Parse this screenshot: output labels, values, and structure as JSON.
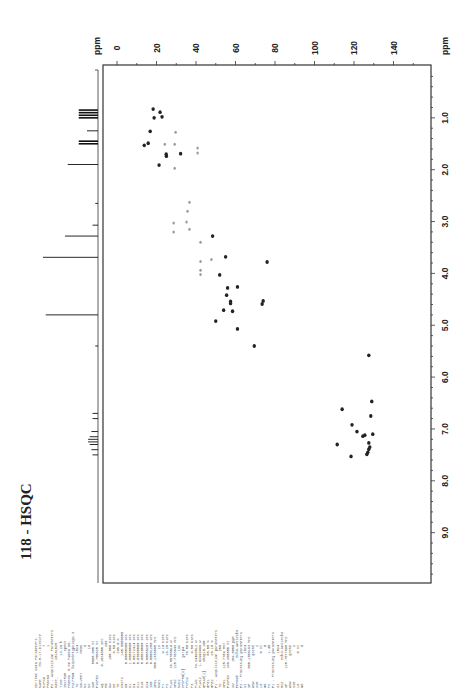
{
  "title": "118 - HSQC",
  "chart_data": {
    "type": "scatter",
    "title": "118 - HSQC",
    "orientation": "rotated 90° (F2 1H axis vertical on right, F1 13C axis horizontal on top)",
    "x_axis": {
      "label": "ppm",
      "nucleus": "13C (F1)",
      "ticks": [
        0,
        20,
        40,
        60,
        80,
        100,
        120,
        140
      ],
      "range": [
        -7,
        158
      ]
    },
    "y_axis": {
      "label": "ppm",
      "nucleus": "1H (F2)",
      "ticks": [
        "1.0",
        "2.0",
        "3.0",
        "4.0",
        "5.0",
        "6.0",
        "7.0",
        "8.0",
        "9.0"
      ],
      "range": [
        0,
        9.95
      ]
    },
    "grid": false,
    "series": [
      {
        "name": "cross peaks (positive, dark)",
        "color": "#222222",
        "points": [
          {
            "c13": 18.3,
            "h1": 0.83
          },
          {
            "c13": 21.8,
            "h1": 0.89
          },
          {
            "c13": 18.8,
            "h1": 1.0
          },
          {
            "c13": 22.8,
            "h1": 0.98
          },
          {
            "c13": 16.8,
            "h1": 1.26
          },
          {
            "c13": 13.8,
            "h1": 1.53
          },
          {
            "c13": 15.8,
            "h1": 1.49
          },
          {
            "c13": 24.9,
            "h1": 1.7
          },
          {
            "c13": 25.0,
            "h1": 1.74
          },
          {
            "c13": 21.3,
            "h1": 1.91
          },
          {
            "c13": 32.2,
            "h1": 1.69
          },
          {
            "c13": 48.4,
            "h1": 3.28
          },
          {
            "c13": 55.0,
            "h1": 3.68
          },
          {
            "c13": 76.0,
            "h1": 3.78
          },
          {
            "c13": 52.0,
            "h1": 4.03
          },
          {
            "c13": 56.0,
            "h1": 4.28
          },
          {
            "c13": 61.0,
            "h1": 4.26
          },
          {
            "c13": 55.5,
            "h1": 4.42
          },
          {
            "c13": 57.5,
            "h1": 4.54
          },
          {
            "c13": 57.5,
            "h1": 4.58
          },
          {
            "c13": 54.0,
            "h1": 4.71
          },
          {
            "c13": 58.5,
            "h1": 4.73
          },
          {
            "c13": 73.5,
            "h1": 4.59
          },
          {
            "c13": 74.0,
            "h1": 4.53
          },
          {
            "c13": 50.0,
            "h1": 4.92
          },
          {
            "c13": 61.0,
            "h1": 5.07
          },
          {
            "c13": 69.5,
            "h1": 5.4
          },
          {
            "c13": 127.5,
            "h1": 5.58
          },
          {
            "c13": 129.0,
            "h1": 6.47
          },
          {
            "c13": 114.0,
            "h1": 6.62
          },
          {
            "c13": 128.5,
            "h1": 6.75
          },
          {
            "c13": 119.0,
            "h1": 6.92
          },
          {
            "c13": 121.5,
            "h1": 7.05
          },
          {
            "c13": 124.5,
            "h1": 7.14
          },
          {
            "c13": 125.5,
            "h1": 7.12
          },
          {
            "c13": 129.5,
            "h1": 7.1
          },
          {
            "c13": 111.5,
            "h1": 7.3
          },
          {
            "c13": 127.5,
            "h1": 7.27
          },
          {
            "c13": 128.0,
            "h1": 7.35
          },
          {
            "c13": 127.5,
            "h1": 7.39
          },
          {
            "c13": 127.0,
            "h1": 7.45
          },
          {
            "c13": 126.5,
            "h1": 7.49
          },
          {
            "c13": 118.5,
            "h1": 7.53
          }
        ]
      },
      {
        "name": "cross peaks (negative/CH2, gray)",
        "color": "#9a9a9a",
        "points": [
          {
            "c13": 29.7,
            "h1": 1.28
          },
          {
            "c13": 24.2,
            "h1": 1.51
          },
          {
            "c13": 29.2,
            "h1": 1.51
          },
          {
            "c13": 40.8,
            "h1": 1.58
          },
          {
            "c13": 40.8,
            "h1": 1.68
          },
          {
            "c13": 29.2,
            "h1": 1.97
          },
          {
            "c13": 36.7,
            "h1": 2.63
          },
          {
            "c13": 35.7,
            "h1": 2.8
          },
          {
            "c13": 28.7,
            "h1": 3.03
          },
          {
            "c13": 35.2,
            "h1": 3.01
          },
          {
            "c13": 28.7,
            "h1": 3.2
          },
          {
            "c13": 36.7,
            "h1": 3.15
          },
          {
            "c13": 42.3,
            "h1": 3.4
          },
          {
            "c13": 42.3,
            "h1": 3.77
          },
          {
            "c13": 47.8,
            "h1": 3.73
          },
          {
            "c13": 42.3,
            "h1": 3.94
          },
          {
            "c13": 42.3,
            "h1": 4.02
          }
        ]
      }
    ],
    "projection_1H": {
      "position": "left of plot (external 1D 1H spectrum)",
      "peaks": [
        {
          "h1": 0.85,
          "height": 0.35
        },
        {
          "h1": 0.9,
          "height": 0.35
        },
        {
          "h1": 0.95,
          "height": 0.35
        },
        {
          "h1": 1.0,
          "height": 0.35
        },
        {
          "h1": 1.25,
          "height": 0.2
        },
        {
          "h1": 1.45,
          "height": 0.35
        },
        {
          "h1": 1.5,
          "height": 0.35
        },
        {
          "h1": 1.9,
          "height": 0.55
        },
        {
          "h1": 2.65,
          "height": 0.05
        },
        {
          "h1": 3.07,
          "height": 0.1
        },
        {
          "h1": 3.28,
          "height": 0.6
        },
        {
          "h1": 3.69,
          "height": 1.0
        },
        {
          "h1": 4.8,
          "height": 0.95
        },
        {
          "h1": 5.4,
          "height": 0.05
        },
        {
          "h1": 6.7,
          "height": 0.1
        },
        {
          "h1": 6.8,
          "height": 0.1
        },
        {
          "h1": 7.05,
          "height": 0.12
        },
        {
          "h1": 7.15,
          "height": 0.15
        },
        {
          "h1": 7.2,
          "height": 0.18
        },
        {
          "h1": 7.25,
          "height": 0.18
        },
        {
          "h1": 7.3,
          "height": 0.15
        },
        {
          "h1": 7.4,
          "height": 0.12
        },
        {
          "h1": 7.5,
          "height": 0.1
        }
      ]
    }
  },
  "axes": {
    "x_unit": "ppm",
    "y_unit": "ppm",
    "x_ticks": [
      "0",
      "20",
      "40",
      "60",
      "80",
      "100",
      "120",
      "140"
    ],
    "y_ticks": [
      "1.0",
      "2.0",
      "3.0",
      "4.0",
      "5.0",
      "6.0",
      "7.0",
      "8.0",
      "9.0"
    ]
  },
  "parameters": {
    "columns": [
      [
        "Current Data Parameters",
        "NAME      MS-5-17-mixture",
        "EXPNO              7",
        "PROCNO             1",
        "",
        "F2 - Acquisition Parameters",
        "Date_        20161025",
        "Time           13.29 h",
        "INSTRUM          spect",
        "PROBHD  5 mm PABBO BB-",
        "PULPROG  hsqcedetgpsisp2.3",
        "TD              1024",
        "SOLVENT         MeOD",
        "NS                 8",
        "DS                16"
      ],
      [
        "SWH        5000.000 Hz",
        "FIDRES     9.765625 Hz",
        "AQ        0.1024000 sec",
        "RG                 203",
        "DW           100.000 usec",
        "DE              6.50 usec",
        "TE              298.0 K",
        "CNST2          145.0000000",
        "D0         0.00000300 sec",
        "D1         1.50000000 sec",
        "D4         0.00172414 sec",
        "D11        0.03000000 sec",
        "D16        0.00020000 sec",
        "D24        0.00086207 sec",
        "IN0        0.00001250 sec"
      ],
      [
        "SFO1     500.1330885 MHz",
        "NUC1              1H",
        "P1              9.10 usec",
        "P2             18.20 usec",
        "PLW1     15.50700016 W",
        "SFO2     125.7703643 MHz",
        "NUC2             13C",
        "CPDPRG[2]     garp4",
        "PCPD2          70.00 usec",
        "P3              9.50 usec",
        "PLW2     79.24499512 W",
        "PLW12     1.62999999 W",
        "GPNAM[1]    SMSQ10.100",
        "GPZ1           80.00 %",
        "GPZ2           20.10 %"
      ],
      [
        "F1 - Acquisition parameters",
        "TD               256",
        "SFO1     125.7704 MHz",
        "FIDRES   156.250000 Hz",
        "SW          159.0000 ppm",
        "FnMODE        Echo-Antiecho",
        "",
        "F2 - Processing parameters",
        "SI              1024",
        "SF       500.1300183 MHz",
        "WDW            QSINE",
        "SSB                2",
        "LB              0 Hz",
        "GB                 0",
        "PC              1.40"
      ],
      [
        "F1 - Processing parameters",
        "SI              1024",
        "MC2          echo-antiecho",
        "SF       125.7577895 MHz",
        "WDW            QSINE",
        "SSB                2",
        "LB              0 Hz",
        "GB                 0"
      ]
    ]
  }
}
